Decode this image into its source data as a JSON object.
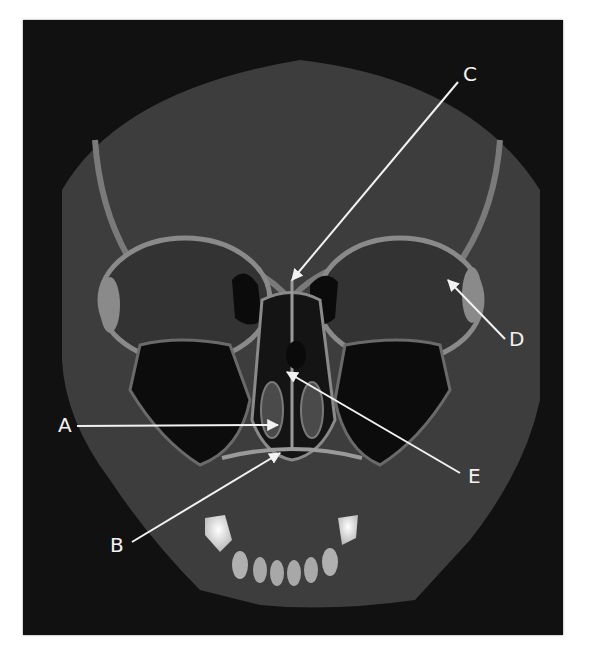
{
  "figure": {
    "background_color": "#111111",
    "label_color": "#f2f2f2",
    "labels": [
      {
        "id": "A",
        "text": "A",
        "x": 58,
        "y": 415,
        "arrow": {
          "x1": 77,
          "y1": 426,
          "x2": 278,
          "y2": 425
        }
      },
      {
        "id": "B",
        "text": "B",
        "x": 110,
        "y": 535,
        "arrow": {
          "x1": 132,
          "y1": 542,
          "x2": 280,
          "y2": 453
        }
      },
      {
        "id": "C",
        "text": "C",
        "x": 463,
        "y": 64,
        "arrow": {
          "x1": 458,
          "y1": 82,
          "x2": 292,
          "y2": 280
        }
      },
      {
        "id": "D",
        "text": "D",
        "x": 509,
        "y": 329,
        "arrow": {
          "x1": 505,
          "y1": 339,
          "x2": 448,
          "y2": 280
        }
      },
      {
        "id": "E",
        "text": "E",
        "x": 468,
        "y": 466,
        "arrow": {
          "x1": 460,
          "y1": 473,
          "x2": 287,
          "y2": 372
        }
      }
    ]
  }
}
